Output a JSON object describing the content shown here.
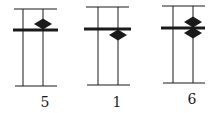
{
  "colors": {
    "ink": "#1a1a1a",
    "background": "#ffffff"
  },
  "figures": [
    {
      "label": "5",
      "top_line": {
        "x1": 14,
        "x2": 57,
        "y": 9
      },
      "verticals": [
        23,
        43
      ],
      "vertical_span": {
        "y1": 9,
        "y2": 86
      },
      "thick_line": {
        "x1": 13,
        "x2": 58,
        "y": 30
      },
      "bottom_line": {
        "x1": 15,
        "x2": 57,
        "y": 86
      },
      "diamonds": [
        {
          "cx": 43,
          "cy": 24,
          "position": "above"
        }
      ],
      "label_pos": {
        "x": 45,
        "y": 107
      }
    },
    {
      "label": "1",
      "top_line": {
        "x1": 86,
        "x2": 129,
        "y": 7
      },
      "verticals": [
        98,
        118
      ],
      "vertical_span": {
        "y1": 7,
        "y2": 85
      },
      "thick_line": {
        "x1": 84,
        "x2": 131,
        "y": 29
      },
      "bottom_line": {
        "x1": 87,
        "x2": 130,
        "y": 85
      },
      "diamonds": [
        {
          "cx": 118,
          "cy": 35,
          "position": "below"
        }
      ],
      "label_pos": {
        "x": 117,
        "y": 107
      }
    },
    {
      "label": "6",
      "top_line": {
        "x1": 162,
        "x2": 205,
        "y": 6
      },
      "verticals": [
        173,
        193
      ],
      "vertical_span": {
        "y1": 6,
        "y2": 83
      },
      "thick_line": {
        "x1": 161,
        "x2": 205,
        "y": 28
      },
      "bottom_line": {
        "x1": 163,
        "x2": 205,
        "y": 83
      },
      "diamonds": [
        {
          "cx": 193,
          "cy": 22,
          "position": "above"
        },
        {
          "cx": 193,
          "cy": 33,
          "position": "below"
        }
      ],
      "label_pos": {
        "x": 192,
        "y": 104
      }
    }
  ]
}
